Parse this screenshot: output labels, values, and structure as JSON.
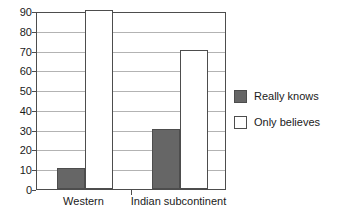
{
  "chart_data": {
    "type": "bar",
    "title": "",
    "xlabel": "",
    "ylabel": "",
    "categories": [
      "Western",
      "Indian subcontinent"
    ],
    "series": [
      {
        "name": "Really knows",
        "values": [
          10,
          30
        ],
        "color": "#666666"
      },
      {
        "name": "Only believes",
        "values": [
          90,
          70
        ],
        "color": "#ffffff"
      }
    ],
    "ylim": [
      0,
      90
    ],
    "ytick_step": 10,
    "yticks": [
      0,
      10,
      20,
      30,
      40,
      50,
      60,
      70,
      80,
      90
    ],
    "ytick_labels": [
      "0",
      "10",
      "20",
      "30",
      "40",
      "50",
      "60",
      "70",
      "80",
      "90"
    ],
    "grid": true,
    "grid_axis": "y",
    "legend_position": "right",
    "legend": [
      "Really knows",
      "Only believes"
    ]
  },
  "axes": {
    "y_labels": [
      "90",
      "80",
      "70",
      "60",
      "50",
      "40",
      "30",
      "20",
      "10",
      "0"
    ],
    "x_labels": [
      "Western",
      "Indian subcontinent"
    ]
  },
  "legend": {
    "items": [
      {
        "label": "Really knows",
        "swatch": "filled"
      },
      {
        "label": "Only believes",
        "swatch": "hollow"
      }
    ]
  },
  "colors": {
    "bar_filled": "#666666",
    "bar_hollow": "#ffffff",
    "bar_border": "#4d4d4d",
    "gridline": "#b3b3b3",
    "axis": "#4d4d4d",
    "text": "#1a1a1a",
    "background": "#ffffff"
  }
}
